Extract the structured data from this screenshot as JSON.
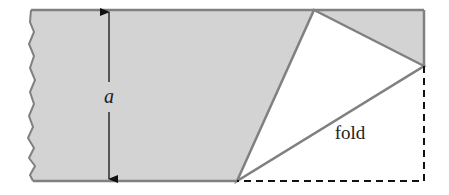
{
  "figure": {
    "type": "folded-strip-diagram",
    "labels": {
      "dimension": "a",
      "fold": "fold"
    },
    "colors": {
      "paper_fill": "#d3d3d3",
      "edge_stroke": "#808080",
      "folded_flap_fill": "#ffffff",
      "dashed_outline": "#111111",
      "arrow": "#111111",
      "text": "#222222"
    },
    "geometry": {
      "strip_top_y": 10,
      "strip_bottom_y": 181,
      "strip_right_x": 424,
      "fold_top_vertex": [
        314,
        10
      ],
      "fold_right_vertex": [
        424,
        66
      ],
      "fold_bottom_vertex": [
        237,
        181
      ],
      "dimension_arrow_x": 109
    }
  }
}
